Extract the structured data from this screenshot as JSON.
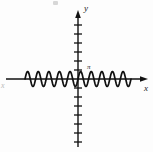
{
  "figure": {
    "type": "math-graph",
    "background_color": "#fdfdfd",
    "stroke_color": "#111111",
    "width": 153,
    "height": 152
  },
  "labels": {
    "y_axis": "y",
    "x_axis": "x",
    "pi_annotation": "π",
    "left_edge_fragment": "x"
  },
  "chart_data": {
    "type": "line",
    "title": "",
    "subtitle": "",
    "xlabel": "x",
    "ylabel": "y",
    "grid": false,
    "legend_position": "none",
    "annotations": [
      {
        "text": "π",
        "x_px": 89,
        "y_px": 68
      }
    ],
    "axes": {
      "origin_px": {
        "x": 78,
        "y": 79
      },
      "x_axis_span_px": {
        "from": 6,
        "to": 148
      },
      "y_axis_span_px": {
        "from": 10,
        "to": 147
      },
      "x_arrow": "right",
      "y_arrow": "up",
      "x_tick_count": 0,
      "y_tick_spacing_px": 9,
      "y_tick_half_width_px": 4,
      "y_ticks_above_origin": 7,
      "y_ticks_below_origin": 7,
      "xlim_px": [
        6,
        148
      ],
      "ylim_px": [
        10,
        147
      ]
    },
    "series": [
      {
        "name": "high-frequency sinusoid",
        "description": "y = a*sin(k*x) rendered as a rapid oscillation along the x-axis",
        "amplitude_px": 7.5,
        "cycles_visible": 10,
        "x_start_px": 25,
        "x_end_px": 131,
        "baseline_y_px": 79,
        "stroke_width_px": 1.6,
        "x": [
          25,
          30.3,
          35.6,
          40.9,
          46.2,
          51.5,
          56.8,
          62.1,
          67.4,
          72.7,
          78,
          83.3,
          88.6,
          93.9,
          99.2,
          104.5,
          109.8,
          115.1,
          120.4,
          125.7,
          131
        ],
        "y": [
          0,
          7.5,
          0,
          -7.5,
          0,
          7.5,
          0,
          -7.5,
          0,
          7.5,
          0,
          -7.5,
          0,
          7.5,
          0,
          -7.5,
          0,
          7.5,
          0,
          -7.5,
          0
        ]
      }
    ]
  }
}
